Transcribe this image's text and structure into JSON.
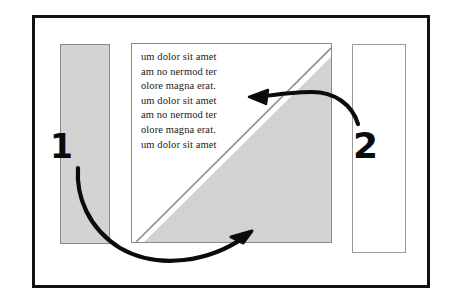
{
  "figure": {
    "title": "",
    "background_color": "#ffffff",
    "frame_color": "#111111",
    "shade_color": "#d3d3d3",
    "outline_color": "#8a8a8a",
    "ink_color": "#0b0b0b"
  },
  "markers": [
    {
      "label": "1",
      "name": "callout-marker-1"
    },
    {
      "label": "2",
      "name": "callout-marker-2"
    }
  ],
  "center_panel": {
    "text_lines": [
      "um dolor sit amet",
      "am no nermod ter",
      "olore magna erat.",
      "um dolor sit amet",
      "am no nermod ter",
      "olore magna erat.",
      "um dolor sit amet"
    ]
  },
  "panels": {
    "left_bar_label": "",
    "right_bar_label": ""
  }
}
